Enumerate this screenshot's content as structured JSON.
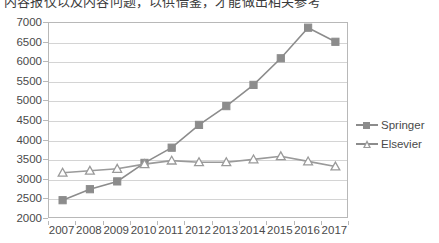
{
  "clipped_header_text": "内容报仅以及内容问题，以供借鉴，才能做出相关参考",
  "chart_data": {
    "type": "line",
    "title": "",
    "xlabel": "",
    "ylabel": "",
    "categories": [
      "2007",
      "2008",
      "2009",
      "2010",
      "2011",
      "2012",
      "2013",
      "2014",
      "2015",
      "2016",
      "2017"
    ],
    "ylim": [
      2000,
      7000
    ],
    "ytick_step": 500,
    "yticks": [
      2000,
      2500,
      3000,
      3500,
      4000,
      4500,
      5000,
      5500,
      6000,
      6500,
      7000
    ],
    "grid": true,
    "legend_position": "right",
    "series": [
      {
        "name": "Springer",
        "marker": "square",
        "color": "#8c8c8c",
        "values": [
          2480,
          2760,
          2960,
          3430,
          3820,
          4400,
          4880,
          5420,
          6100,
          6880,
          6520
        ]
      },
      {
        "name": "Elsevier",
        "marker": "triangle",
        "color": "#9a9a9a",
        "values": [
          3180,
          3230,
          3280,
          3400,
          3490,
          3450,
          3450,
          3520,
          3600,
          3470,
          3340
        ]
      }
    ]
  },
  "legend": {
    "items": [
      {
        "label": "Springer"
      },
      {
        "label": "Elsevier"
      }
    ]
  },
  "colors": {
    "series_gray": "#8c8c8c",
    "gridline": "#d4d4d4",
    "frame": "#b8b8b8",
    "text": "#4a4a4a"
  }
}
